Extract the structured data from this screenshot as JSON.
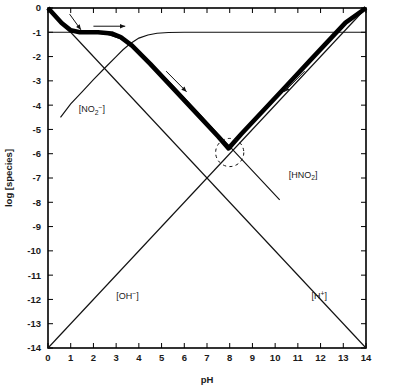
{
  "figure": {
    "name": "log-concentration-ph-diagram"
  },
  "axes": {
    "x": {
      "title": "pH",
      "min": 0,
      "max": 14,
      "ticks": [
        "0",
        "1",
        "2",
        "3",
        "4",
        "5",
        "6",
        "7",
        "8",
        "9",
        "10",
        "11",
        "12",
        "13",
        "14"
      ]
    },
    "y": {
      "title": "log [species]",
      "min": -14,
      "max": 0,
      "ticks": [
        "0",
        "-1",
        "-2",
        "-3",
        "-4",
        "-5",
        "-6",
        "-7",
        "-8",
        "-9",
        "-10",
        "-11",
        "-12",
        "-13",
        "-14"
      ]
    }
  },
  "series_labels": {
    "nitrite": {
      "base": "[NO",
      "sub": "2",
      "sup": "−",
      "close": "]",
      "text": "[NO2-]"
    },
    "nitrous_acid": {
      "base": "[HNO",
      "sub": "2",
      "close": "]",
      "text": "[HNO2]"
    },
    "hydroxide": {
      "base": "[OH",
      "sup": "−",
      "close": "]",
      "text": "[OH-]"
    },
    "hydrogen": {
      "base": "[H",
      "sup": "+",
      "close": "]",
      "text": "[H+]"
    }
  },
  "colors": {
    "ink": "#000000",
    "background": "#ffffff",
    "thin_stroke": "#111111"
  },
  "chart_data": {
    "type": "line",
    "title": "",
    "xlabel": "pH",
    "ylabel": "log [species]",
    "xlim": [
      0,
      14
    ],
    "ylim": [
      -14,
      0
    ],
    "grid": false,
    "legend": "inline-annotations",
    "analytical_concentration_log": -1,
    "pKa": 3.3,
    "series": [
      {
        "name": "[NO2-]",
        "label_position": {
          "x": 1.35,
          "y": -4.3
        },
        "points": [
          [
            0.55,
            -4.5
          ],
          [
            1.0,
            -3.95
          ],
          [
            1.5,
            -3.45
          ],
          [
            2.0,
            -2.95
          ],
          [
            2.5,
            -2.47
          ],
          [
            3.0,
            -2.0
          ],
          [
            3.3,
            -1.72
          ],
          [
            3.6,
            -1.48
          ],
          [
            4.0,
            -1.24
          ],
          [
            4.4,
            -1.11
          ],
          [
            4.8,
            -1.04
          ],
          [
            5.3,
            -1.01
          ],
          [
            6.0,
            -1.0
          ],
          [
            8.0,
            -1.0
          ],
          [
            11.0,
            -1.0
          ],
          [
            14.0,
            -1.0
          ]
        ]
      },
      {
        "name": "[HNO2]",
        "label_position": {
          "x": 10.6,
          "y": -7.0
        },
        "points": [
          [
            0.0,
            -1.0
          ],
          [
            1.0,
            -1.0
          ],
          [
            2.0,
            -1.02
          ],
          [
            2.6,
            -1.08
          ],
          [
            3.0,
            -1.2
          ],
          [
            3.3,
            -1.3
          ],
          [
            3.8,
            -1.6
          ],
          [
            4.5,
            -2.25
          ],
          [
            5.5,
            -3.2
          ],
          [
            6.5,
            -4.2
          ],
          [
            7.5,
            -5.2
          ],
          [
            8.5,
            -6.2
          ],
          [
            9.5,
            -7.2
          ],
          [
            10.2,
            -7.9
          ]
        ]
      },
      {
        "name": "[OH-]",
        "label_position": {
          "x": 3.0,
          "y": -12.0
        },
        "points": [
          [
            0,
            -14
          ],
          [
            14,
            0
          ]
        ]
      },
      {
        "name": "[H+]",
        "label_position": {
          "x": 11.6,
          "y": -12.0
        },
        "points": [
          [
            0,
            0
          ],
          [
            14,
            -14
          ]
        ]
      },
      {
        "name": "proton-condition-curve",
        "style": "heavy",
        "points": [
          [
            0.0,
            0.0
          ],
          [
            0.6,
            -0.62
          ],
          [
            1.0,
            -0.92
          ],
          [
            1.4,
            -1.0
          ],
          [
            2.2,
            -1.0
          ],
          [
            2.8,
            -1.05
          ],
          [
            3.2,
            -1.2
          ],
          [
            3.7,
            -1.55
          ],
          [
            4.5,
            -2.3
          ],
          [
            5.5,
            -3.3
          ],
          [
            6.5,
            -4.3
          ],
          [
            7.5,
            -5.3
          ],
          [
            7.95,
            -5.78
          ],
          [
            8.5,
            -5.2
          ],
          [
            9.5,
            -4.2
          ],
          [
            10.5,
            -3.2
          ],
          [
            11.5,
            -2.2
          ],
          [
            12.5,
            -1.2
          ],
          [
            13.1,
            -0.6
          ],
          [
            14.0,
            0.0
          ]
        ]
      }
    ],
    "annotations": [
      {
        "type": "arrow",
        "name": "arrow-top-left-diagonal",
        "from": [
          0.95,
          -0.25
        ],
        "to": [
          1.45,
          -0.9
        ]
      },
      {
        "type": "arrow",
        "name": "arrow-top-horizontal",
        "from": [
          2.0,
          -0.75
        ],
        "to": [
          3.4,
          -0.75
        ]
      },
      {
        "type": "arrow",
        "name": "arrow-descending-branch",
        "from": [
          5.2,
          -2.6
        ],
        "to": [
          6.1,
          -3.45
        ]
      },
      {
        "type": "arrow",
        "name": "arrow-ascending-branch",
        "from": [
          11.3,
          -2.6
        ],
        "to": [
          10.4,
          -3.45
        ]
      },
      {
        "type": "circle",
        "name": "equivalence-point-marker",
        "center": [
          8.0,
          -5.95
        ],
        "radius_ph": 0.62
      }
    ]
  }
}
